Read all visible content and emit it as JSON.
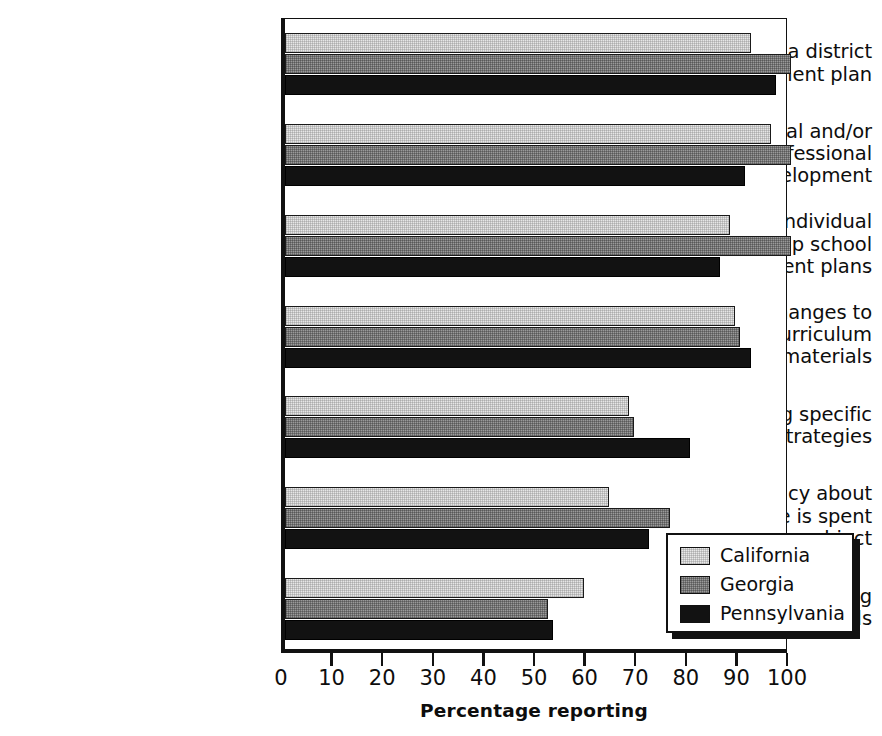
{
  "chart_data": {
    "type": "bar",
    "orientation": "horizontal",
    "title": "",
    "xlabel": "Percentage reporting",
    "ylabel": "",
    "xlim": [
      0,
      100
    ],
    "xticks": [
      0,
      10,
      20,
      30,
      40,
      50,
      60,
      70,
      80,
      90,
      100
    ],
    "grid": false,
    "legend_position": "inside-lower-right",
    "categories": [
      "Developing a district\nimprovement plan",
      "Focusing principal and/or\nteacher professional\ndevelopment",
      "Helping individual\nschools develop school\nimprovement plans",
      "Making changes to\nthe district's curriculum\nand instruction materials",
      "Recommending specific\ninstructional strategies",
      "Making policy about\nhow much time is spent\non each academic subject",
      "Allocating\nresources among schools"
    ],
    "series": [
      {
        "name": "California",
        "color": "#e8e8e8",
        "values": [
          92,
          96,
          88,
          89,
          68,
          64,
          59
        ]
      },
      {
        "name": "Georgia",
        "color": "#9a9a9a",
        "values": [
          100,
          100,
          100,
          90,
          69,
          76,
          52
        ]
      },
      {
        "name": "Pennsylvania",
        "color": "#121212",
        "values": [
          97,
          91,
          86,
          92,
          80,
          72,
          53
        ]
      }
    ]
  },
  "axis": {
    "tick_labels": [
      "0",
      "10",
      "20",
      "30",
      "40",
      "50",
      "60",
      "70",
      "80",
      "90",
      "100"
    ],
    "x_axis_title": "Percentage reporting"
  },
  "legend": {
    "entries": [
      {
        "label": "California"
      },
      {
        "label": "Georgia"
      },
      {
        "label": "Pennsylvania"
      }
    ]
  }
}
